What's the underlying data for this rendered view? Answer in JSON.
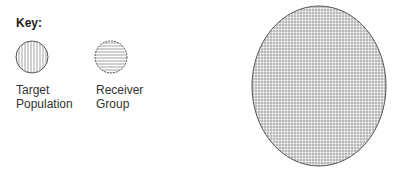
{
  "key": {
    "title": "Key:",
    "items": [
      {
        "label_line1": "Target",
        "label_line2": "Population",
        "pattern": "vertical-lines"
      },
      {
        "label_line1": "Receiver",
        "label_line2": "Group",
        "pattern": "horizontal-lines"
      }
    ]
  },
  "main_shape": {
    "pattern": "crosshatch-grid",
    "shape": "ellipse"
  },
  "colors": {
    "stroke": "#555555",
    "hatch": "#777777",
    "background": "#ffffff"
  }
}
